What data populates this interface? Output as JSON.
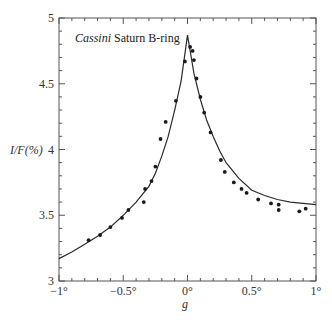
{
  "chart_data": {
    "type": "scatter",
    "title": "",
    "annotation": {
      "italic": "Cassini",
      "rest": " Saturn B-ring"
    },
    "xlabel": "g",
    "ylabel": "I/F(%)",
    "xlim": [
      -1,
      1
    ],
    "ylim": [
      3,
      5
    ],
    "grid": false,
    "legend": null,
    "x_ticks": [
      {
        "value": -1,
        "label": "−1°"
      },
      {
        "value": -0.5,
        "label": "−0.5°"
      },
      {
        "value": 0,
        "label": "0°"
      },
      {
        "value": 0.5,
        "label": "0.5°"
      },
      {
        "value": 1,
        "label": "1°"
      }
    ],
    "x_minor_step": 0.1,
    "y_ticks": [
      {
        "value": 3,
        "label": "3"
      },
      {
        "value": 3.5,
        "label": "3.5"
      },
      {
        "value": 4,
        "label": "4"
      },
      {
        "value": 4.5,
        "label": "4.5"
      },
      {
        "value": 5,
        "label": "5"
      }
    ],
    "y_minor_step": 0.1,
    "series": [
      {
        "name": "Observations",
        "kind": "points",
        "x": [
          -0.77,
          -0.68,
          -0.6,
          -0.51,
          -0.46,
          -0.34,
          -0.33,
          -0.28,
          -0.25,
          -0.21,
          -0.17,
          -0.09,
          -0.02,
          0.02,
          0.04,
          0.05,
          0.07,
          0.1,
          0.13,
          0.18,
          0.26,
          0.29,
          0.36,
          0.42,
          0.46,
          0.55,
          0.65,
          0.71,
          0.71,
          0.87,
          0.92
        ],
        "y": [
          3.31,
          3.35,
          3.41,
          3.48,
          3.54,
          3.6,
          3.7,
          3.76,
          3.87,
          4.08,
          4.21,
          4.37,
          4.67,
          4.78,
          4.75,
          4.68,
          4.54,
          4.4,
          4.28,
          4.13,
          3.92,
          3.83,
          3.75,
          3.7,
          3.67,
          3.62,
          3.59,
          3.58,
          3.54,
          3.53,
          3.55
        ]
      },
      {
        "name": "Model fit",
        "kind": "line",
        "x": [
          -1.0,
          -0.9,
          -0.8,
          -0.75,
          -0.7,
          -0.6,
          -0.5,
          -0.4,
          -0.3,
          -0.25,
          -0.2,
          -0.15,
          -0.1,
          -0.05,
          0.0,
          0.05,
          0.1,
          0.15,
          0.2,
          0.25,
          0.3,
          0.4,
          0.5,
          0.6,
          0.7,
          0.8,
          0.9,
          1.0
        ],
        "y": [
          3.17,
          3.22,
          3.28,
          3.31,
          3.34,
          3.41,
          3.5,
          3.6,
          3.72,
          3.82,
          3.95,
          4.1,
          4.3,
          4.52,
          4.87,
          4.58,
          4.38,
          4.22,
          4.1,
          3.99,
          3.9,
          3.78,
          3.69,
          3.65,
          3.62,
          3.6,
          3.59,
          3.58
        ]
      }
    ],
    "colors": {
      "axis": "#555555",
      "line": "#2a2a2a",
      "points": "#1a1a1a"
    }
  }
}
